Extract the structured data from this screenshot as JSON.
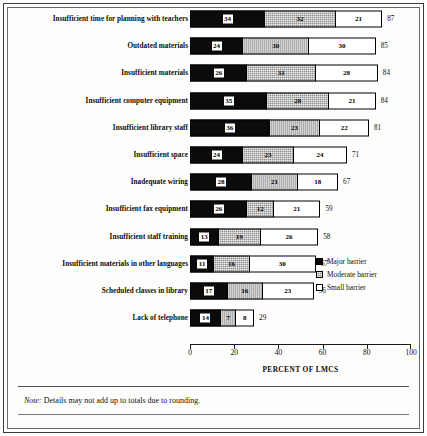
{
  "chart_data": {
    "type": "bar",
    "orientation": "horizontal",
    "stacked": true,
    "title": "",
    "xlabel": "PERCENT OF LMCS",
    "ylabel": "",
    "xlim": [
      0,
      100
    ],
    "xticks": [
      0,
      20,
      40,
      60,
      80,
      100
    ],
    "grid": false,
    "legend_position": "right-inside",
    "categories": [
      "Insufficient time for planning with teachers",
      "Outdated materials",
      "Insufficient materials",
      "Insufficient computer equipment",
      "Insufficient library staff",
      "Insufficient space",
      "Inadequate wiring",
      "Insufficient fax equipment",
      "Insufficient staff training",
      "Insufficient materials in other languages",
      "Scheduled classes in library",
      "Lack of telephone"
    ],
    "series": [
      {
        "name": "Major barrier",
        "values": [
          34,
          24,
          26,
          35,
          36,
          24,
          28,
          26,
          13,
          11,
          17,
          14
        ]
      },
      {
        "name": "Moderate barrier",
        "values": [
          32,
          30,
          31,
          28,
          23,
          23,
          21,
          12,
          19,
          16,
          16,
          7
        ]
      },
      {
        "name": "Small barrier",
        "values": [
          21,
          30,
          28,
          21,
          22,
          24,
          18,
          21,
          26,
          30,
          23,
          8
        ]
      }
    ],
    "totals": [
      87,
      85,
      84,
      84,
      81,
      71,
      67,
      59,
      58,
      57,
      56,
      29
    ],
    "note": "Details may not add up to totals due to rounding.",
    "note_lead": "Note:"
  },
  "legend": {
    "items": [
      {
        "label": "Major barrier",
        "swatch": "solid-black"
      },
      {
        "label": "Moderate barrier",
        "swatch": "hatched-gray"
      },
      {
        "label": "Small barrier",
        "swatch": "white-outline"
      }
    ]
  },
  "colors": {
    "major": "#0b0b0b",
    "moderate": "#8e8e8e",
    "small": "#ffffff",
    "frame": "#3a3a3a",
    "text": "#111111"
  }
}
